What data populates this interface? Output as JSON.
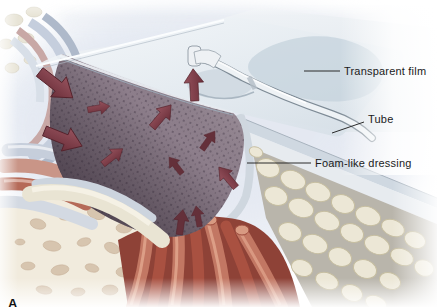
{
  "figure": {
    "panel_letter": "A",
    "labels": {
      "transparent_film": "Transparent film",
      "tube": "Tube",
      "foam_dressing": "Foam-like dressing"
    }
  },
  "colors": {
    "film": "#dde5ec",
    "film_blob": "#c3d1dc",
    "foam": "#8a7b88",
    "foam_dark": "#5a4c5a",
    "arrow": "#7c3b46",
    "arrow_dark": "#64303a",
    "muscle": "#b55f4e",
    "fat": "#ece7d6",
    "tissue_cream": "#f1ebdd",
    "vignette": "#d9e0ec",
    "label_text": "#1b1b1b",
    "leader_line": "#2b2b2b"
  }
}
